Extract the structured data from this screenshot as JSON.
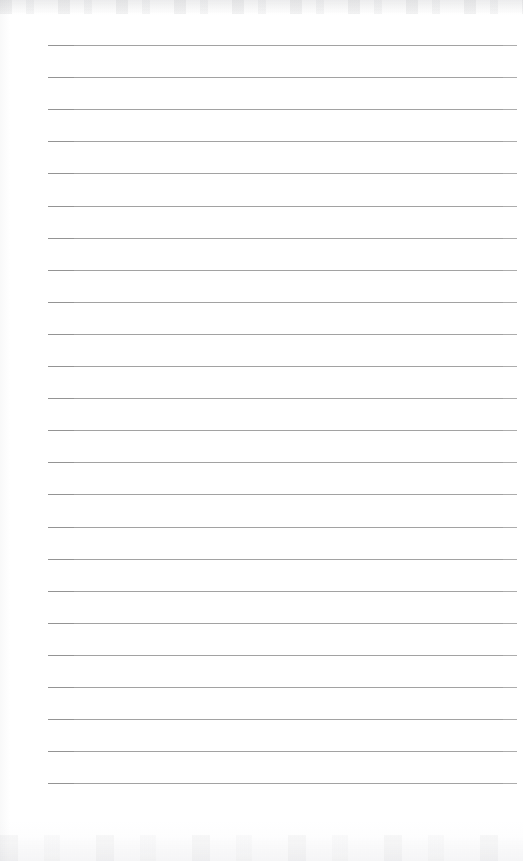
{
  "document": {
    "kind": "scanned-lined-notepad-page",
    "page_label": "",
    "content_text": "",
    "is_blank": true
  },
  "page": {
    "width": 523,
    "height": 861,
    "background_color": "#fefefe"
  },
  "ruling": {
    "line_color": "#9b9b9b",
    "line_thickness": 1,
    "line_start_x": 48,
    "line_end_x": 517,
    "first_line_y": 45,
    "line_spacing": 32.1,
    "line_count": 24,
    "lines_y": [
      45,
      77.1,
      109.2,
      141.3,
      173.4,
      205.5,
      237.6,
      269.7,
      301.8,
      333.9,
      366,
      398.1,
      430.2,
      462.3,
      494.4,
      526.5,
      558.6,
      590.7,
      622.8,
      654.9,
      687,
      719.1,
      751.2,
      783.3
    ]
  },
  "scan_artifacts": {
    "top_edge_tint": "#8a8c92",
    "bottom_edge_tint": "#9295a0",
    "left_edge_tint": "#82848a"
  }
}
